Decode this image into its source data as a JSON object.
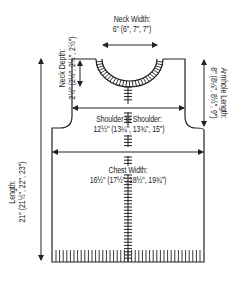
{
  "diagram": {
    "type": "knitting-schematic",
    "line_color": "#222222",
    "background": "#ffffff"
  },
  "measurements": {
    "neck_width": {
      "label": "Neck Width:",
      "value": "6\" (6\", 7\", 7\")"
    },
    "neck_depth": {
      "label": "Neck Depth:",
      "value": "2½\" (2½\", 2½\", 2½\")"
    },
    "armhole_length": {
      "label": "Armhole Length:",
      "value": "8\" (8¼\", 8½\", 9\")"
    },
    "shoulder_to_shoulder": {
      "label": "Shoulder to Shoulder:",
      "value": "12½\" (13¼\", 13¾\", 15\")"
    },
    "length": {
      "label": "Length:",
      "value": "21\" (21½\", 22\", 23\")"
    },
    "chest_width": {
      "label": "Chest Width:",
      "value": "16½\" (17½\", 18½\", 19¾\")"
    }
  }
}
